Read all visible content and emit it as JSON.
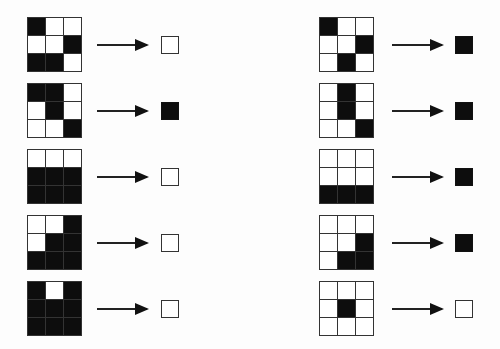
{
  "colors": {
    "black": "#0d0d0d",
    "white": "#ffffff",
    "line": "#333333"
  },
  "columns": [
    {
      "side": "left",
      "examples": [
        {
          "grid": [
            1,
            0,
            0,
            0,
            0,
            1,
            1,
            1,
            0
          ],
          "output": 0
        },
        {
          "grid": [
            1,
            1,
            0,
            0,
            1,
            0,
            0,
            0,
            1
          ],
          "output": 1
        },
        {
          "grid": [
            0,
            0,
            0,
            1,
            1,
            1,
            1,
            1,
            1
          ],
          "output": 0
        },
        {
          "grid": [
            0,
            0,
            1,
            0,
            1,
            1,
            1,
            1,
            1
          ],
          "output": 0
        },
        {
          "grid": [
            1,
            0,
            1,
            1,
            1,
            1,
            1,
            1,
            1
          ],
          "output": 0
        }
      ]
    },
    {
      "side": "right",
      "examples": [
        {
          "grid": [
            1,
            0,
            0,
            0,
            0,
            1,
            0,
            1,
            0
          ],
          "output": 1
        },
        {
          "grid": [
            0,
            1,
            0,
            0,
            1,
            0,
            0,
            0,
            1
          ],
          "output": 1
        },
        {
          "grid": [
            0,
            0,
            0,
            0,
            0,
            0,
            1,
            1,
            1
          ],
          "output": 1
        },
        {
          "grid": [
            0,
            0,
            0,
            0,
            0,
            1,
            0,
            1,
            1
          ],
          "output": 1
        },
        {
          "grid": [
            0,
            0,
            0,
            0,
            1,
            0,
            0,
            0,
            0
          ],
          "output": 0
        }
      ]
    }
  ],
  "legend": {
    "1": "black cell",
    "0": "white cell"
  }
}
